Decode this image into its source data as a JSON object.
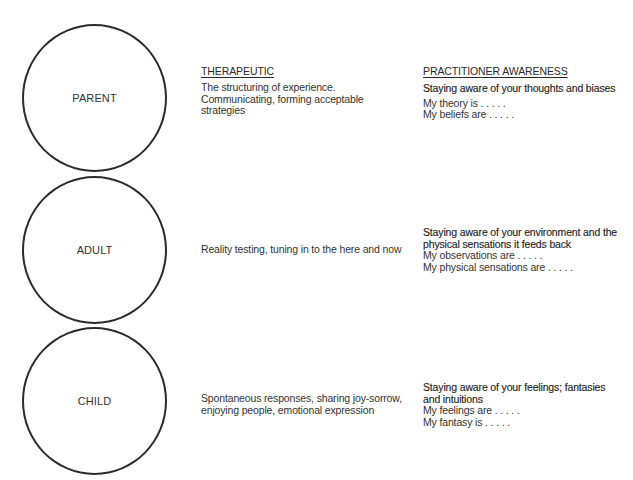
{
  "headings": {
    "therapeutic": "THERAPEUTIC",
    "practitioner": "PRACTITIONER AWARENESS"
  },
  "states": [
    {
      "label": "PARENT",
      "therapeutic": [
        "The structuring of experience.",
        "Communicating, forming acceptable",
        "strategies"
      ],
      "awareness_lead": [
        "Staying aware of your thoughts and biases"
      ],
      "awareness_prompts": [
        "My theory is . . . . .",
        "My beliefs are . . . . ."
      ]
    },
    {
      "label": "ADULT",
      "therapeutic": [
        "Reality testing, tuning in to the here and now"
      ],
      "awareness_lead": [
        "Staying aware of your environment and the",
        "physical sensations it feeds back"
      ],
      "awareness_prompts": [
        "My observations are . . . . .",
        "My physical sensations are . . . . ."
      ]
    },
    {
      "label": "CHILD",
      "therapeutic": [
        "Spontaneous responses, sharing joy-sorrow,",
        "enjoying people, emotional expression"
      ],
      "awareness_lead": [
        "Staying aware of your feelings; fantasies",
        "and intuitions"
      ],
      "awareness_prompts": [
        "My feelings are . . . . .",
        "My fantasy is . . . . ."
      ]
    }
  ]
}
